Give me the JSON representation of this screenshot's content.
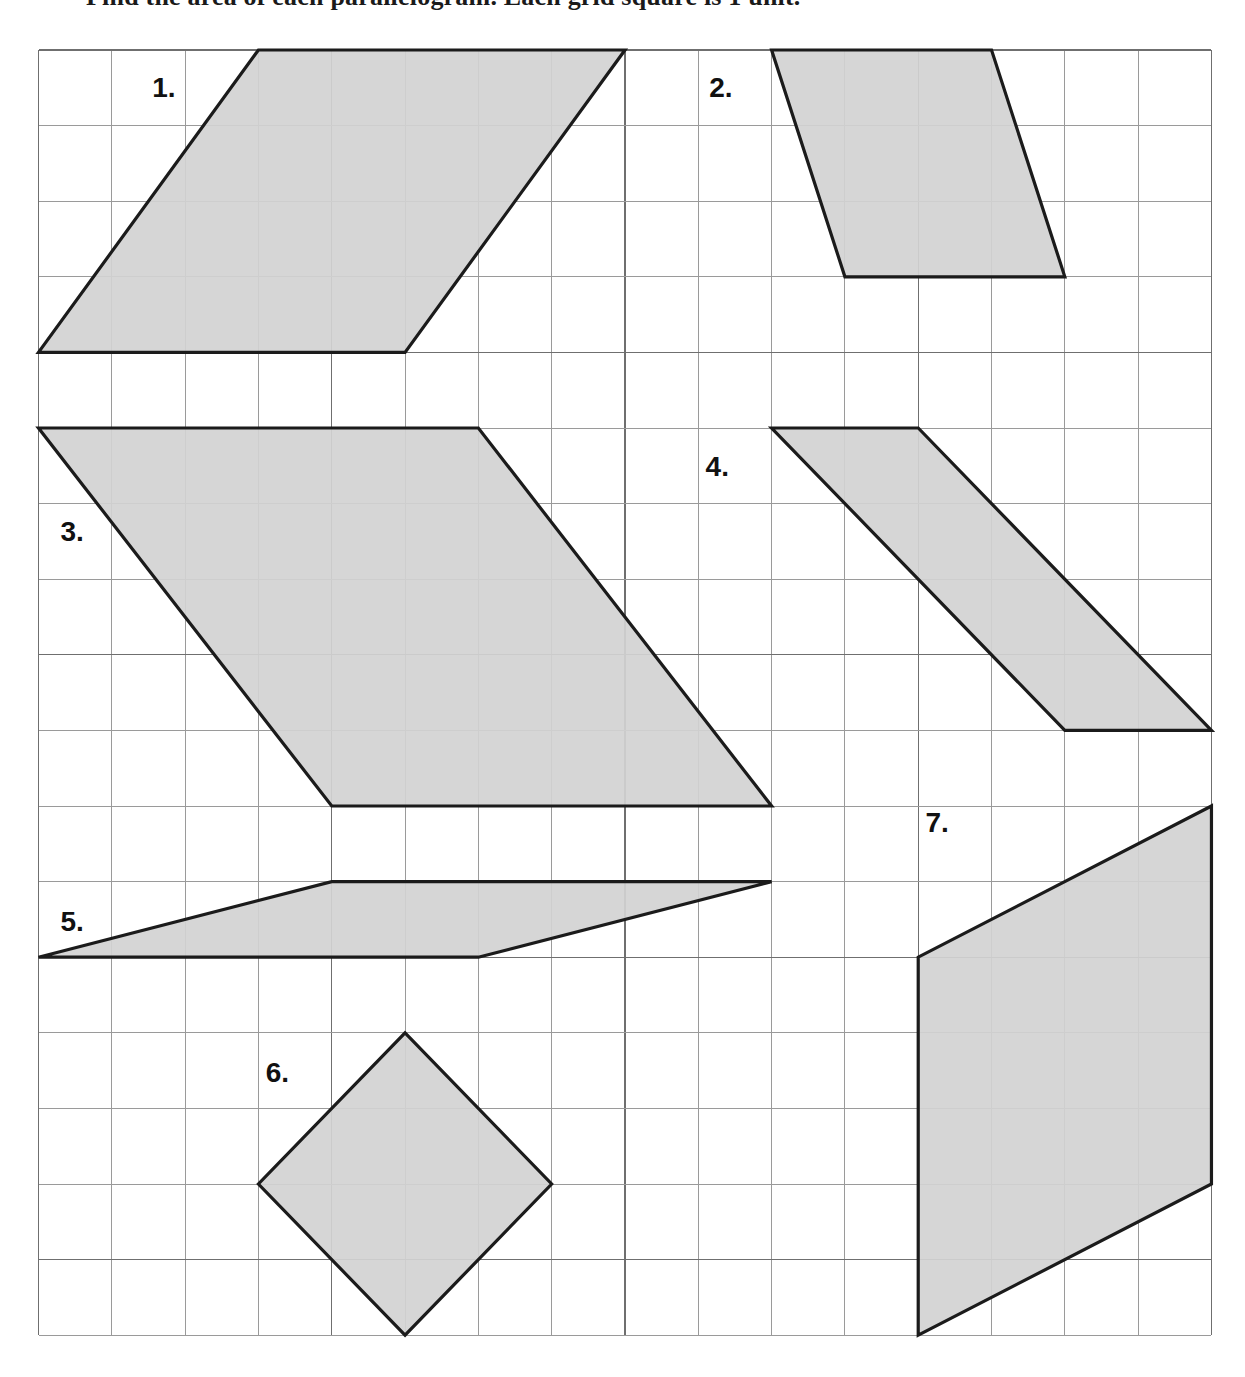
{
  "page": {
    "instruction": "Find the area of each parallelogram. Each grid square is 1 unit.",
    "background_color": "#ffffff"
  },
  "grid": {
    "origin_x": 38.5,
    "origin_y": 50,
    "cell_width": 73.31,
    "cell_height": 75.6,
    "columns": 16,
    "rows": 17,
    "line_color": "#9a9a9a",
    "major_line_color": "#6f6f6f"
  },
  "style": {
    "shape_fill": "#d2d2d2",
    "shape_stroke": "#1b1b1b",
    "label_color": "#111111"
  },
  "chart_data": {
    "type": "diagram",
    "xlabel": "grid columns",
    "ylabel": "grid rows",
    "xlim": [
      0,
      16
    ],
    "ylim": [
      0,
      17
    ],
    "grid": true,
    "legend": "none",
    "units": "grid squares",
    "shapes": [
      {
        "label": "1.",
        "kind": "parallelogram",
        "vertices": [
          [
            3,
            0
          ],
          [
            8,
            0
          ],
          [
            5,
            4
          ],
          [
            0,
            4
          ]
        ],
        "base": 5,
        "height": 4,
        "area": 20,
        "label_cell": [
          1.55,
          0.62
        ]
      },
      {
        "label": "2.",
        "kind": "parallelogram",
        "vertices": [
          [
            10,
            0
          ],
          [
            13,
            0
          ],
          [
            14,
            3
          ],
          [
            11,
            3
          ]
        ],
        "base": 3,
        "height": 3,
        "area": 9,
        "label_cell": [
          9.15,
          0.62
        ]
      },
      {
        "label": "3.",
        "kind": "parallelogram",
        "vertices": [
          [
            0,
            5
          ],
          [
            6,
            5
          ],
          [
            10,
            10
          ],
          [
            4,
            10
          ]
        ],
        "base": 6,
        "height": 5,
        "area": 30,
        "label_cell": [
          0.3,
          6.5
        ]
      },
      {
        "label": "4.",
        "kind": "parallelogram",
        "vertices": [
          [
            10,
            5
          ],
          [
            12,
            5
          ],
          [
            16,
            9
          ],
          [
            14,
            9
          ]
        ],
        "base": 2,
        "height": 4,
        "area": 8,
        "label_cell": [
          9.1,
          5.63
        ]
      },
      {
        "label": "5.",
        "kind": "parallelogram",
        "vertices": [
          [
            4,
            11
          ],
          [
            10,
            11
          ],
          [
            6,
            12
          ],
          [
            0,
            12
          ]
        ],
        "base": 6,
        "height": 1,
        "area": 6,
        "label_cell": [
          0.3,
          11.65
        ]
      },
      {
        "label": "6.",
        "kind": "rhombus",
        "vertices": [
          [
            5,
            13
          ],
          [
            7,
            15
          ],
          [
            5,
            17
          ],
          [
            3,
            15
          ]
        ],
        "base": 2,
        "height": 2,
        "area": 8,
        "label_cell": [
          3.1,
          13.65
        ]
      },
      {
        "label": "7.",
        "kind": "parallelogram",
        "vertices": [
          [
            16,
            10
          ],
          [
            12,
            12
          ],
          [
            12,
            17
          ],
          [
            16,
            15
          ]
        ],
        "base": 5,
        "height": 4,
        "area": 20,
        "label_cell": [
          12.1,
          10.35
        ]
      }
    ]
  }
}
